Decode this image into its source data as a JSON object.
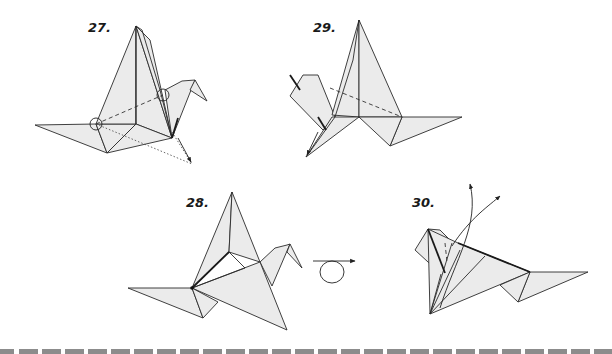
{
  "diagram": {
    "type": "origami-instructions",
    "steps": [
      {
        "number": "27.",
        "description": "crane with wings; circled pivot points on wing and neck, dashed fold line, dotted arrow indicating fold down"
      },
      {
        "number": "28.",
        "description": "crane after fold, wing rotated down and forward"
      },
      {
        "number": "29.",
        "description": "crane viewed with head at left, dashed fold line, arrow to lower tip"
      },
      {
        "number": "30.",
        "description": "crane with curved arrows pulling wings upward"
      }
    ],
    "symbols": {
      "turn_over": "turn-over-icon"
    },
    "colors": {
      "paper": "#ebebeb",
      "line": "#2a2a2a",
      "cut_strip": "#8c8c8c",
      "background": "#ffffff"
    }
  }
}
